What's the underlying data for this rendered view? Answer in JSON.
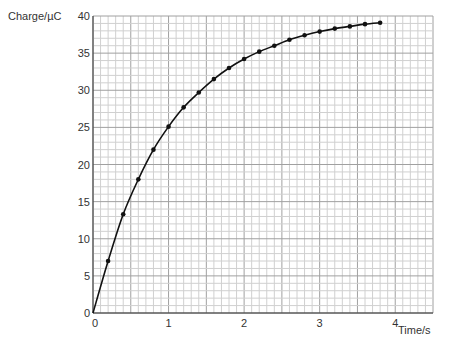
{
  "chart_data": {
    "type": "line",
    "title": "",
    "xlabel": "Time/s",
    "ylabel": "Charge/µC",
    "xlim": [
      0,
      4.5
    ],
    "ylim": [
      0,
      40
    ],
    "x_ticks": [
      "0",
      "1",
      "2",
      "3",
      "4"
    ],
    "y_ticks": [
      "0",
      "5",
      "10",
      "15",
      "20",
      "25",
      "30",
      "35",
      "40"
    ],
    "grid": true,
    "legend": "none",
    "series": [
      {
        "name": "Charge",
        "marker": "dot",
        "x": [
          0,
          0.2,
          0.4,
          0.6,
          0.8,
          1.0,
          1.2,
          1.4,
          1.6,
          1.8,
          2.0,
          2.2,
          2.4,
          2.6,
          2.8,
          3.0,
          3.2,
          3.4,
          3.6,
          3.8
        ],
        "values": [
          0,
          7.0,
          13.3,
          18.0,
          22.0,
          25.1,
          27.7,
          29.7,
          31.5,
          33.0,
          34.2,
          35.2,
          36.0,
          36.8,
          37.4,
          37.9,
          38.3,
          38.6,
          38.9,
          39.1
        ]
      }
    ]
  },
  "colors": {
    "minor_grid": "#d0d0d0",
    "major_grid": "#a0a0a0",
    "axis": "#333333",
    "curve": "#111111"
  }
}
